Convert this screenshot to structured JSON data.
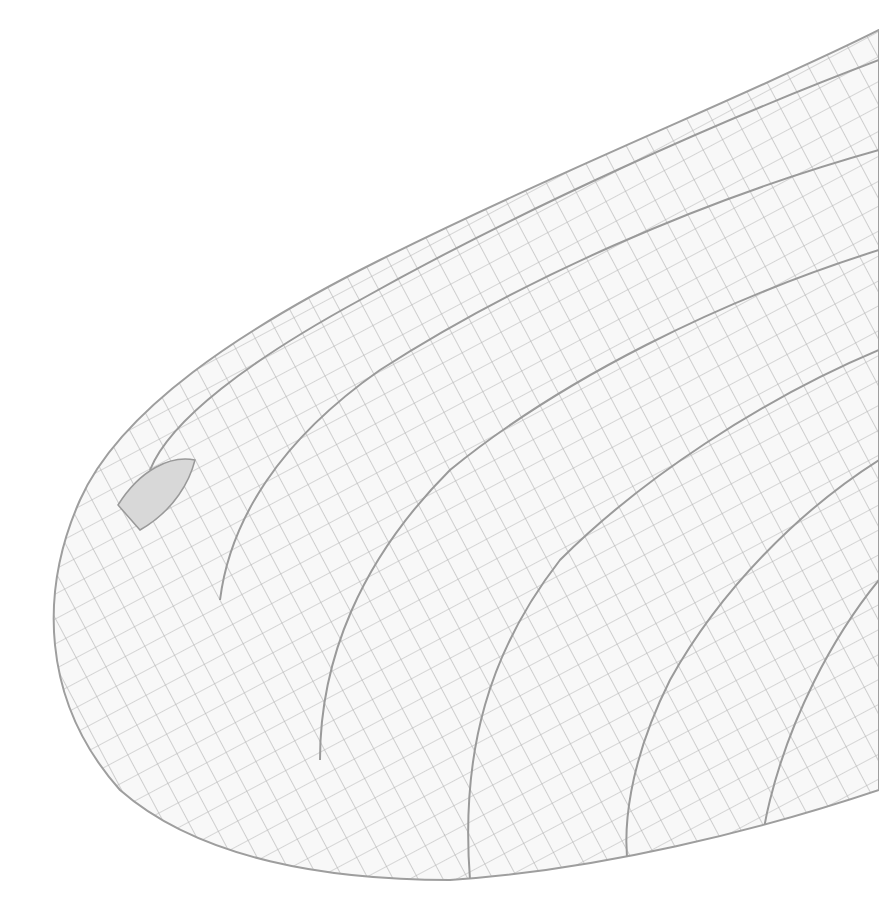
{
  "image": {
    "subject": "Dragonfly wing venation (apical portion)",
    "background_color": "#ffffff",
    "vein_color": "#a9a9a9",
    "membrane_color": "#f7f7f7",
    "pterostigma_color": "#d9d9d9"
  }
}
